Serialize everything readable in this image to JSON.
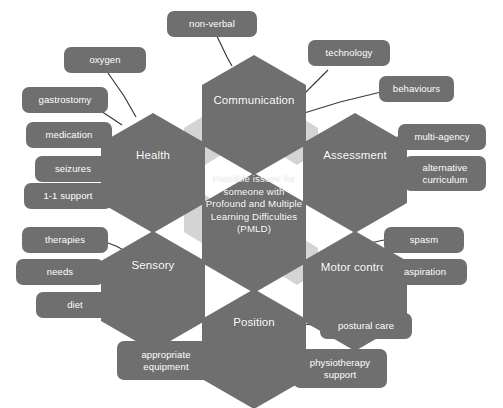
{
  "diagram": {
    "title": "Possible issues for someone with Profound and Multiple Learning Difficulties (PMLD)",
    "type": "hexagonal mind map",
    "colors": {
      "hex_fill": "#6f6f6f",
      "hex_gap_fill": "#d3d3d3",
      "box_fill": "#6f6f6f",
      "text": "#ffffff",
      "edge": "#3a3a3a",
      "background": "#ffffff"
    },
    "center": {
      "line1": "Possible issues for",
      "line2": "someone with",
      "line3": "Profound and Multiple",
      "line4": "Learning Difficulties",
      "line5": "(PMLD)"
    },
    "hexagons": [
      {
        "id": "communication",
        "label": "Communication"
      },
      {
        "id": "health",
        "label": "Health"
      },
      {
        "id": "assessment",
        "label": "Assessment"
      },
      {
        "id": "sensory",
        "label": "Sensory"
      },
      {
        "id": "motor-control",
        "label": "Motor control"
      },
      {
        "id": "position",
        "label": "Position"
      }
    ],
    "boxes": [
      {
        "id": "non-verbal",
        "label": "non-verbal",
        "parent": "communication"
      },
      {
        "id": "technology",
        "label": "technology",
        "parent": "communication"
      },
      {
        "id": "behaviours",
        "label": "behaviours",
        "parent": "communication"
      },
      {
        "id": "oxygen",
        "label": "oxygen",
        "parent": "health"
      },
      {
        "id": "gastrostomy",
        "label": "gastrostomy",
        "parent": "health"
      },
      {
        "id": "medication",
        "label": "medication",
        "parent": "health"
      },
      {
        "id": "seizures",
        "label": "seizures",
        "parent": "health"
      },
      {
        "id": "one-to-one-support",
        "label": "1-1 support",
        "parent": "health"
      },
      {
        "id": "multi-agency",
        "label": "multi-agency",
        "parent": "assessment"
      },
      {
        "id": "alternative-curriculum",
        "label": "alternative curriculum",
        "parent": "assessment"
      },
      {
        "id": "therapies",
        "label": "therapies",
        "parent": "sensory"
      },
      {
        "id": "needs",
        "label": "needs",
        "parent": "sensory"
      },
      {
        "id": "diet",
        "label": "diet",
        "parent": "sensory"
      },
      {
        "id": "spasm",
        "label": "spasm",
        "parent": "motor-control"
      },
      {
        "id": "aspiration",
        "label": "aspiration",
        "parent": "motor-control"
      },
      {
        "id": "postural-care",
        "label": "postural care",
        "parent": "position"
      },
      {
        "id": "appropriate-equipment",
        "label": "appropriate equipment",
        "parent": "position"
      },
      {
        "id": "physiotherapy-support",
        "label": "physiotherapy support",
        "parent": "position"
      }
    ]
  }
}
